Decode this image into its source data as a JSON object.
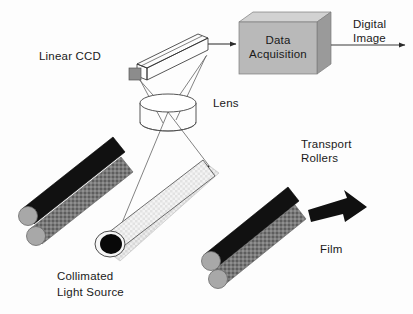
{
  "figure": {
    "background_color": "#fdfdfd"
  },
  "labels": {
    "linear_ccd": "Linear CCD",
    "lens": "Lens",
    "data_acquisition_line1": "Data",
    "data_acquisition_line2": "Acquisition",
    "digital_image_line1": "Digital",
    "digital_image_line2": "Image",
    "transport_rollers_line1": "Transport",
    "transport_rollers_line2": "Rollers",
    "collimated_line1": "Collimated",
    "collimated_line2": "Light Source",
    "film": "Film"
  },
  "icons": {
    "ccd_sensor": "linear-ccd-bar-icon",
    "ccd_active_face": "ccd-sensor-face-icon",
    "lens": "lens-cylinder-icon",
    "daq_box": "data-acquisition-box-icon",
    "output_arrow": "digital-image-arrow-icon",
    "input_arrow": "ccd-to-daq-arrow-icon",
    "roller_left": "transport-roller-pair-left-icon",
    "roller_right": "transport-roller-pair-right-icon",
    "light_source": "collimated-light-source-icon",
    "film_strip": "film-strip-icon",
    "motion_arrow": "film-motion-arrow-icon",
    "ray_bundle": "optical-ray-bundle-icon"
  },
  "colors": {
    "daq_box_front": "#b9b9b9",
    "daq_box_top": "#d2d2d2",
    "daq_box_side": "#9a9a9a",
    "roller_dark": "#111111",
    "roller_mid": "#777777",
    "roller_cap": "#a8a8a8",
    "ccd_face": "#8c8c8c",
    "light_body": "#f2f2f2",
    "lamp_end": "#080808",
    "film_line": "#1a1a1a",
    "arrow_black": "#101010",
    "outline": "#2b2b2b",
    "ray": "#5a5a5a",
    "text": "#1a1a1a"
  },
  "geometry": {
    "canvas_width": 413,
    "canvas_height": 314,
    "lens_center": [
      168,
      112
    ],
    "ccd_face_center": [
      133,
      73
    ],
    "daq_box_front": [
      239,
      22,
      78,
      52
    ],
    "film_strip_start": [
      106,
      244
    ],
    "film_strip_end": [
      210,
      166
    ]
  }
}
